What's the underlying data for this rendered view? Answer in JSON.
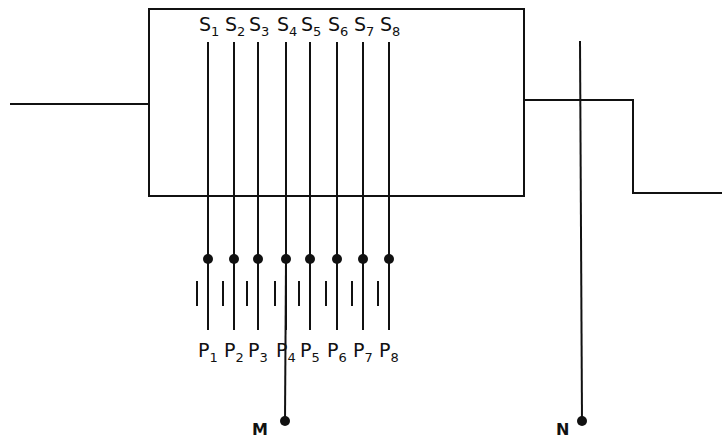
{
  "diagram": {
    "box": {
      "x": 149,
      "y": 9,
      "width": 375,
      "height": 187
    },
    "input_line": {
      "x1": 10,
      "x2": 149,
      "y": 104
    },
    "output_step": {
      "x_start": 524,
      "y_high": 100,
      "x_step": 633,
      "y_low": 193,
      "x_end": 722
    },
    "switches": [
      {
        "s_label": "S",
        "s_sub": "1",
        "p_label": "P",
        "p_sub": "1",
        "x": 208
      },
      {
        "s_label": "S",
        "s_sub": "2",
        "p_label": "P",
        "p_sub": "2",
        "x": 234
      },
      {
        "s_label": "S",
        "s_sub": "3",
        "p_label": "P",
        "p_sub": "3",
        "x": 258
      },
      {
        "s_label": "S",
        "s_sub": "4",
        "p_label": "P",
        "p_sub": "4",
        "x": 286
      },
      {
        "s_label": "S",
        "s_sub": "5",
        "p_label": "P",
        "p_sub": "5",
        "x": 310
      },
      {
        "s_label": "S",
        "s_sub": "6",
        "p_label": "P",
        "p_sub": "6",
        "x": 337
      },
      {
        "s_label": "S",
        "s_sub": "7",
        "p_label": "P",
        "p_sub": "7",
        "x": 363
      },
      {
        "s_label": "S",
        "s_sub": "8",
        "p_label": "P",
        "p_sub": "8",
        "x": 389
      }
    ],
    "terminals": {
      "M": {
        "label": "M",
        "x": 285,
        "y": 421
      },
      "N": {
        "label": "N",
        "x": 582,
        "y": 421
      }
    },
    "stroke_color": "#111111"
  }
}
